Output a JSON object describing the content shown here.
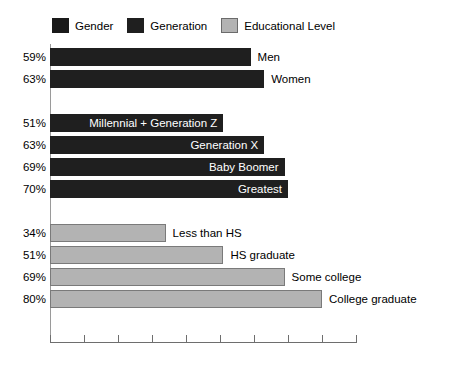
{
  "legend": {
    "entries": [
      {
        "label": "Gender",
        "color": "#1a1a1a",
        "key": "gender"
      },
      {
        "label": "Generation",
        "color": "#1f1f1f",
        "key": "generation"
      },
      {
        "label": "Educational Level",
        "color": "#b3b3b3",
        "key": "edu"
      }
    ]
  },
  "chart_data": {
    "type": "bar",
    "orientation": "horizontal",
    "title": "",
    "subtitle": "",
    "xlabel": "",
    "ylabel": "",
    "xlim": [
      0,
      90
    ],
    "x_tick_values": [
      0,
      10,
      20,
      30,
      40,
      50,
      60,
      70,
      80,
      90
    ],
    "x_tick_labels": [
      "",
      "",
      "",
      "",
      "",
      "",
      "",
      "",
      "",
      ""
    ],
    "grid": false,
    "legend_position": "top-left",
    "value_suffix": "%",
    "groups": [
      {
        "name": "Gender",
        "series_color": "#1f1f1f",
        "label_placement": "outside",
        "categories": [
          "Men",
          "Women"
        ],
        "values": [
          59,
          63
        ],
        "value_labels": [
          "59%",
          "63%"
        ]
      },
      {
        "name": "Generation",
        "series_color": "#1f1f1f",
        "label_placement": "inside",
        "categories": [
          "Millennial + Generation Z",
          "Generation X",
          "Baby Boomer",
          "Greatest"
        ],
        "values": [
          51,
          63,
          69,
          70
        ],
        "value_labels": [
          "51%",
          "63%",
          "69%",
          "70%"
        ]
      },
      {
        "name": "Educational Level",
        "series_color": "#b3b3b3",
        "label_placement": "outside",
        "categories": [
          "Less than HS",
          "HS graduate",
          "Some college",
          "College graduate"
        ],
        "values": [
          34,
          51,
          69,
          80
        ],
        "value_labels": [
          "34%",
          "51%",
          "69%",
          "80%"
        ]
      }
    ]
  },
  "bars": [
    {
      "group": "Gender",
      "category": "Men",
      "value": 34,
      "value_label": "59%",
      "pct": "59%",
      "label": "Men",
      "style": "dark",
      "placement": "outside"
    },
    {
      "group": "Gender",
      "category": "Women",
      "value": 63,
      "value_label": "63%",
      "pct": "63%",
      "label": "Women",
      "style": "dark",
      "placement": "outside"
    },
    {
      "group": "Generation",
      "category": "Millennial + Generation Z",
      "value": 51,
      "pct": "51%",
      "label": "Millennial + Generation Z",
      "style": "dark",
      "placement": "inside"
    },
    {
      "group": "Generation",
      "category": "Generation X",
      "value": 63,
      "pct": "63%",
      "label": "Generation X",
      "style": "dark",
      "placement": "inside"
    },
    {
      "group": "Generation",
      "category": "Baby Boomer",
      "value": 69,
      "pct": "69%",
      "label": "Baby Boomer",
      "style": "dark",
      "placement": "inside"
    },
    {
      "group": "Generation",
      "category": "Greatest",
      "value": 70,
      "pct": "70%",
      "label": "Greatest",
      "style": "dark",
      "placement": "inside"
    },
    {
      "group": "Educational Level",
      "category": "Less than HS",
      "value": 34,
      "pct": "34%",
      "label": "Less than HS",
      "style": "gray",
      "placement": "outside"
    },
    {
      "group": "Educational Level",
      "category": "HS graduate",
      "value": 51,
      "pct": "51%",
      "label": "HS graduate",
      "style": "gray",
      "placement": "outside"
    },
    {
      "group": "Educational Level",
      "category": "Some college",
      "value": 69,
      "pct": "69%",
      "label": "Some college",
      "style": "gray",
      "placement": "outside"
    },
    {
      "group": "Educational Level",
      "category": "College graduate",
      "value": 80,
      "pct": "80%",
      "label": "College graduate",
      "style": "gray",
      "placement": "outside"
    }
  ],
  "layout": {
    "bar_px_per_unit": 3.81,
    "bar_height": 18,
    "bar_gap": 4,
    "group_gap": 22,
    "plot_left": 50,
    "plot_top": 44,
    "axis_height": 298,
    "tick_count": 10,
    "tick_step_px": 34
  }
}
